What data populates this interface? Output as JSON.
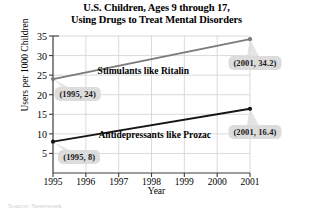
{
  "chart_data": {
    "type": "line",
    "title": "U.S. Children, Ages 9 through 17, Using Drugs to Treat Mental Disorders",
    "title_lines": [
      "U.S. Children, Ages 9 through 17,",
      "Using Drugs to Treat Mental Disorders"
    ],
    "xlabel": "Year",
    "ylabel": "Users per 1000 Children",
    "x": [
      1995,
      2001
    ],
    "xlim": [
      1995,
      2001
    ],
    "ylim": [
      0,
      35
    ],
    "xticks": [
      1995,
      1996,
      1997,
      1998,
      1999,
      2000,
      2001
    ],
    "xtick_labels": [
      "1995",
      "1996",
      "1997",
      "1998",
      "1999",
      "2000",
      "2001"
    ],
    "yticks": [
      5,
      10,
      15,
      20,
      25,
      30,
      35
    ],
    "ytick_labels": [
      "5",
      "10",
      "15",
      "20",
      "25",
      "30",
      "35"
    ],
    "grid": true,
    "legend": "none",
    "series": [
      {
        "name": "Stimulants like Ritalin",
        "color": "#7a7a7a",
        "values": [
          24,
          34.2
        ],
        "annotation": "Stimulants like Ritalin"
      },
      {
        "name": "Antidepressants like Prozac",
        "color": "#151515",
        "values": [
          8,
          16.4
        ],
        "annotation": "Antidepressants like Prozac"
      }
    ],
    "point_labels": [
      {
        "text": "(1995, 24)",
        "x": 1995,
        "y": 24
      },
      {
        "text": "(2001, 34.2)",
        "x": 2001,
        "y": 34.2
      },
      {
        "text": "(1995, 8)",
        "x": 1995,
        "y": 8
      },
      {
        "text": "(2001, 16.4)",
        "x": 2001,
        "y": 16.4
      }
    ],
    "colors": {
      "grid": "#d6d6d6",
      "axis": "#3c3c3c",
      "callout_bg": "#dcdcdc",
      "stimulants": "#7a7a7a",
      "antidepressants": "#151515"
    }
  },
  "source_note": "Source: Newsweek"
}
